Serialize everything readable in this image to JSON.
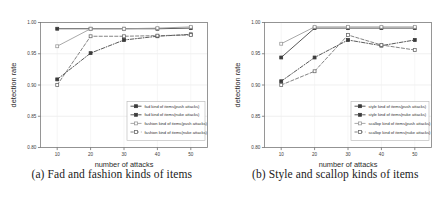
{
  "figure": {
    "panels": [
      {
        "id": "panel-a",
        "caption": "(a) Fad and fashion kinds of items",
        "chart_data": {
          "type": "line",
          "title": "",
          "xlabel": "number of attacks",
          "ylabel": "detection rate",
          "x": [
            10,
            20,
            30,
            40,
            50
          ],
          "xticks": [
            "10",
            "20",
            "30",
            "40",
            "50"
          ],
          "yticks": [
            "0.80",
            "0.85",
            "0.90",
            "0.95",
            "1.00"
          ],
          "xlim": [
            5,
            55
          ],
          "ylim": [
            0.8,
            1.0
          ],
          "grid": true,
          "legend_position": "lower-right",
          "series": [
            {
              "name": "fad kind of items(push attacks)",
              "values": [
                0.99,
                0.99,
                0.99,
                0.99,
                0.991
              ],
              "marker": "square-filled",
              "dash": "solid",
              "color": "#3b3b3b"
            },
            {
              "name": "fad kind of items(nuke attacks)",
              "values": [
                0.909,
                0.951,
                0.972,
                0.978,
                0.981
              ],
              "marker": "square-filled",
              "dash": "dash-dot",
              "color": "#3b3b3b"
            },
            {
              "name": "fashion kind of items(push attacks)",
              "values": [
                0.962,
                0.99,
                0.99,
                0.991,
                0.993
              ],
              "marker": "square-open",
              "dash": "solid",
              "color": "#9a9a9a"
            },
            {
              "name": "fashion kind of items(nuke attacks)",
              "values": [
                0.9,
                0.978,
                0.978,
                0.979,
                0.98
              ],
              "marker": "square-open",
              "dash": "dashed",
              "color": "#6d6d6d"
            }
          ]
        }
      },
      {
        "id": "panel-b",
        "caption": "(b) Style and scallop kinds of items",
        "chart_data": {
          "type": "line",
          "title": "",
          "xlabel": "number of attacks",
          "ylabel": "detection rate",
          "x": [
            10,
            20,
            30,
            40,
            50
          ],
          "xticks": [
            "10",
            "20",
            "30",
            "40",
            "50"
          ],
          "yticks": [
            "0.80",
            "0.85",
            "0.90",
            "0.95",
            "1.00"
          ],
          "xlim": [
            5,
            55
          ],
          "ylim": [
            0.8,
            1.0
          ],
          "grid": true,
          "legend_position": "lower-right",
          "series": [
            {
              "name": "style kind of items(push attacks)",
              "values": [
                0.944,
                0.991,
                0.991,
                0.991,
                0.991
              ],
              "marker": "square-filled",
              "dash": "solid",
              "color": "#3b3b3b"
            },
            {
              "name": "style kind of items(nuke attacks)",
              "values": [
                0.906,
                0.944,
                0.972,
                0.963,
                0.972
              ],
              "marker": "square-filled",
              "dash": "dash-dot",
              "color": "#3b3b3b"
            },
            {
              "name": "scallop kind of items(push attacks)",
              "values": [
                0.966,
                0.993,
                0.993,
                0.993,
                0.993
              ],
              "marker": "square-open",
              "dash": "solid",
              "color": "#9a9a9a"
            },
            {
              "name": "scallop kind of items(nuke attacks)",
              "values": [
                0.9,
                0.922,
                0.98,
                0.964,
                0.956
              ],
              "marker": "square-open",
              "dash": "dashed",
              "color": "#6d6d6d"
            }
          ]
        }
      }
    ]
  }
}
